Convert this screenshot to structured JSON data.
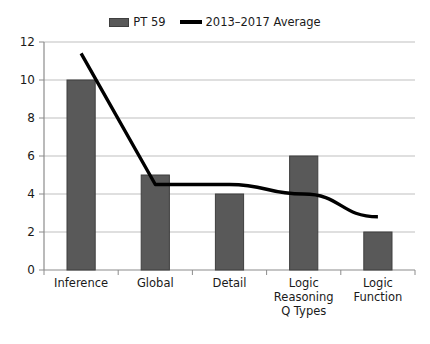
{
  "legend": {
    "entries": [
      {
        "label": "PT 59",
        "marker": "bar-swatch",
        "color": "#595959"
      },
      {
        "label": "2013–2017 Average",
        "marker": "line-swatch",
        "color": "#000000"
      }
    ]
  },
  "axes": {
    "y_ticks": [
      "0",
      "2",
      "4",
      "6",
      "8",
      "10",
      "12"
    ],
    "x_labels": [
      "Inference",
      "Global",
      "Detail",
      "Logic Reasoning Q Types",
      "Logic Function"
    ]
  },
  "chart_data": {
    "type": "bar",
    "title": "",
    "subtitle": "",
    "xlabel": "",
    "ylabel": "",
    "ylim": [
      0,
      12
    ],
    "ytick_step": 2,
    "grid": true,
    "legend_position": "top-center",
    "categories": [
      "Inference",
      "Global",
      "Detail",
      "Logic Reasoning Q Types",
      "Logic Function"
    ],
    "series": [
      {
        "name": "PT 59",
        "type": "bar",
        "color": "#595959",
        "values": [
          10,
          5,
          4,
          6,
          2
        ]
      },
      {
        "name": "2013–2017 Average",
        "type": "line",
        "color": "#000000",
        "values": [
          11.4,
          4.5,
          4.5,
          4.0,
          2.8
        ]
      }
    ]
  }
}
